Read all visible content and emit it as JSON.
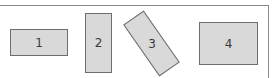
{
  "diagram": {
    "frame": {
      "stroke_color": "#8a8a8a",
      "edges": [
        "top",
        "right"
      ]
    },
    "shapes": [
      {
        "id": "1",
        "label": "1",
        "type": "rectangle",
        "orientation": "landscape",
        "rotation_deg": 0,
        "fill": "#d9d9d9",
        "stroke": "#6e6e6e"
      },
      {
        "id": "2",
        "label": "2",
        "type": "rectangle",
        "orientation": "portrait",
        "rotation_deg": 0,
        "fill": "#d9d9d9",
        "stroke": "#6e6e6e"
      },
      {
        "id": "3",
        "label": "3",
        "type": "rectangle",
        "orientation": "portrait",
        "rotation_deg": -35,
        "fill": "#d9d9d9",
        "stroke": "#6e6e6e"
      },
      {
        "id": "4",
        "label": "4",
        "type": "rectangle",
        "orientation": "landscape",
        "rotation_deg": 0,
        "fill": "#d9d9d9",
        "stroke": "#6e6e6e"
      }
    ]
  }
}
